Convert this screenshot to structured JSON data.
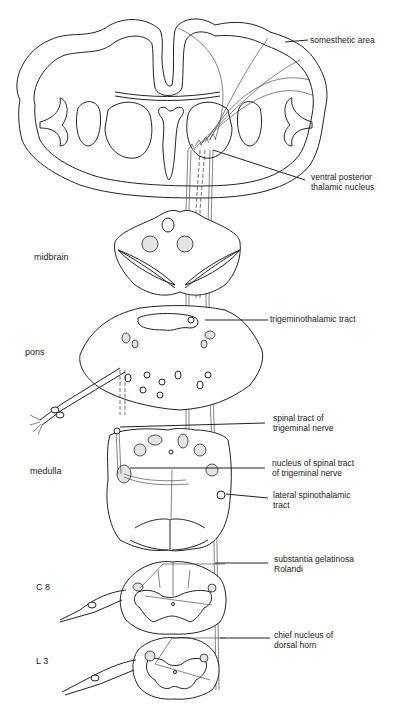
{
  "figure": {
    "levels": {
      "midbrain": "midbrain",
      "pons": "pons",
      "medulla": "medulla",
      "c8": "C 8",
      "l3": "L 3"
    },
    "labels": {
      "somesthetic_area": "somesthetic area",
      "vpn_line1": "ventral posterior",
      "vpn_line2": "thalamic nucleus",
      "trigeminothalamic": "trigeminothalamic tract",
      "spinal_tract_line1": "spinal tract of",
      "spinal_tract_line2": "trigeminal nerve",
      "nucleus_spinal_line1": "nucleus of spinal tract",
      "nucleus_spinal_line2": "of trigeminal nerve",
      "lateral_st_line1": "lateral spinothalamic",
      "lateral_st_line2": "tract",
      "sg_line1": "substantia gelatinosa",
      "sg_line2": "Rolandi",
      "chief_line1": "chief nucleus of",
      "chief_line2": "dorsal horn"
    },
    "colors": {
      "line": "#222222",
      "stipple": "#e4e4e4",
      "background": "#ffffff"
    }
  }
}
